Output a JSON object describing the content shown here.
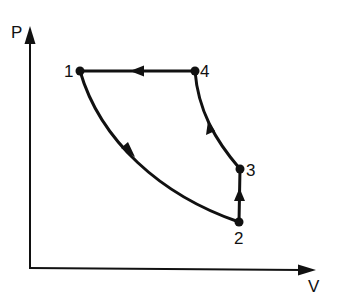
{
  "diagram": {
    "type": "pressure-volume cycle diagram",
    "axes": {
      "y_label": "P",
      "x_label": "V"
    },
    "points": [
      {
        "id": "1",
        "label": "1"
      },
      {
        "id": "2",
        "label": "2"
      },
      {
        "id": "3",
        "label": "3"
      },
      {
        "id": "4",
        "label": "4"
      }
    ],
    "paths": [
      {
        "from": "1",
        "to": "2",
        "shape": "curve",
        "direction": "down-right"
      },
      {
        "from": "2",
        "to": "3",
        "shape": "vertical line",
        "direction": "up"
      },
      {
        "from": "3",
        "to": "4",
        "shape": "curve",
        "direction": "up-left"
      },
      {
        "from": "4",
        "to": "1",
        "shape": "horizontal line",
        "direction": "left"
      }
    ],
    "colors": {
      "line": "#111111",
      "background": "#ffffff"
    }
  }
}
